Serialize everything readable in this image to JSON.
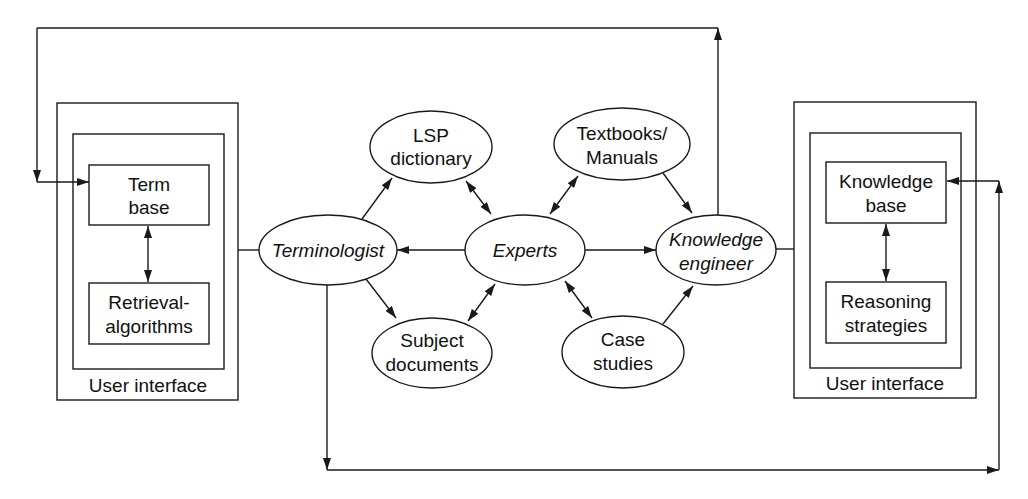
{
  "diagram": {
    "left_system": {
      "frame_label": "User interface",
      "top_box": {
        "line1": "Term",
        "line2": "base"
      },
      "bottom_box": {
        "line1": "Retrieval-",
        "line2": "algorithms"
      }
    },
    "right_system": {
      "frame_label": "User interface",
      "top_box": {
        "line1": "Knowledge",
        "line2": "base"
      },
      "bottom_box": {
        "line1": "Reasoning",
        "line2": "strategies"
      }
    },
    "nodes": {
      "terminologist": {
        "label": "Terminologist"
      },
      "experts": {
        "label": "Experts"
      },
      "knowledge_engineer": {
        "line1": "Knowledge",
        "line2": "engineer"
      },
      "lsp_dictionary": {
        "line1": "LSP",
        "line2": "dictionary"
      },
      "textbooks_manuals": {
        "line1": "Textbooks/",
        "line2": "Manuals"
      },
      "subject_documents": {
        "line1": "Subject",
        "line2": "documents"
      },
      "case_studies": {
        "line1": "Case",
        "line2": "studies"
      }
    },
    "edges": [
      {
        "from": "terminologist",
        "to": "lsp_dictionary",
        "type": "directed"
      },
      {
        "from": "terminologist",
        "to": "subject_documents",
        "type": "directed"
      },
      {
        "from": "experts",
        "to": "terminologist",
        "type": "directed"
      },
      {
        "from": "experts",
        "to": "knowledge_engineer",
        "type": "directed"
      },
      {
        "from": "experts",
        "to": "lsp_dictionary",
        "type": "bidirectional"
      },
      {
        "from": "experts",
        "to": "textbooks_manuals",
        "type": "bidirectional"
      },
      {
        "from": "experts",
        "to": "subject_documents",
        "type": "bidirectional"
      },
      {
        "from": "experts",
        "to": "case_studies",
        "type": "bidirectional"
      },
      {
        "from": "textbooks_manuals",
        "to": "knowledge_engineer",
        "type": "directed"
      },
      {
        "from": "case_studies",
        "to": "knowledge_engineer",
        "type": "directed"
      },
      {
        "from": "terminologist",
        "to": "left_system",
        "type": "line"
      },
      {
        "from": "knowledge_engineer",
        "to": "right_system",
        "type": "line"
      },
      {
        "from": "knowledge_engineer",
        "to": "term_base",
        "type": "directed"
      },
      {
        "from": "terminologist",
        "to": "knowledge_base",
        "type": "directed"
      },
      {
        "from": "term_base",
        "to": "retrieval_algorithms",
        "type": "bidirectional"
      },
      {
        "from": "knowledge_base",
        "to": "reasoning_strategies",
        "type": "bidirectional"
      }
    ],
    "colors": {
      "stroke": "#1a1a1a",
      "text": "#111111",
      "background": "#ffffff"
    }
  }
}
